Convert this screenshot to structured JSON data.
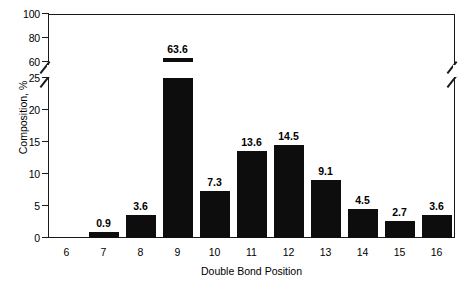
{
  "chart_data": {
    "type": "bar",
    "title": "",
    "xlabel": "Double Bond Position",
    "ylabel": "Composition, %",
    "categories": [
      "6",
      "7",
      "8",
      "9",
      "10",
      "11",
      "12",
      "13",
      "14",
      "15",
      "16"
    ],
    "values": [
      0,
      0.9,
      3.6,
      63.6,
      7.3,
      13.6,
      14.5,
      9.1,
      4.5,
      2.7,
      3.6
    ],
    "value_labels": [
      "",
      "0.9",
      "3.6",
      "63.6",
      "7.3",
      "13.6",
      "14.5",
      "9.1",
      "4.5",
      "2.7",
      "3.6"
    ],
    "grid": false,
    "legend": "none",
    "broken_axis": true,
    "axis_break": {
      "lower_range": [
        0,
        25
      ],
      "upper_range": [
        60,
        100
      ],
      "break_low": 25,
      "break_high": 60
    },
    "ylim": [
      0,
      100
    ],
    "y_ticks_lower": [
      "0",
      "5",
      "10",
      "15",
      "20",
      "25"
    ],
    "y_ticks_upper": [
      "60",
      "80",
      "100"
    ],
    "bar_color": "#0d0d0d",
    "axis_color": "#1a1a1a",
    "background_color": "#ffffff"
  }
}
